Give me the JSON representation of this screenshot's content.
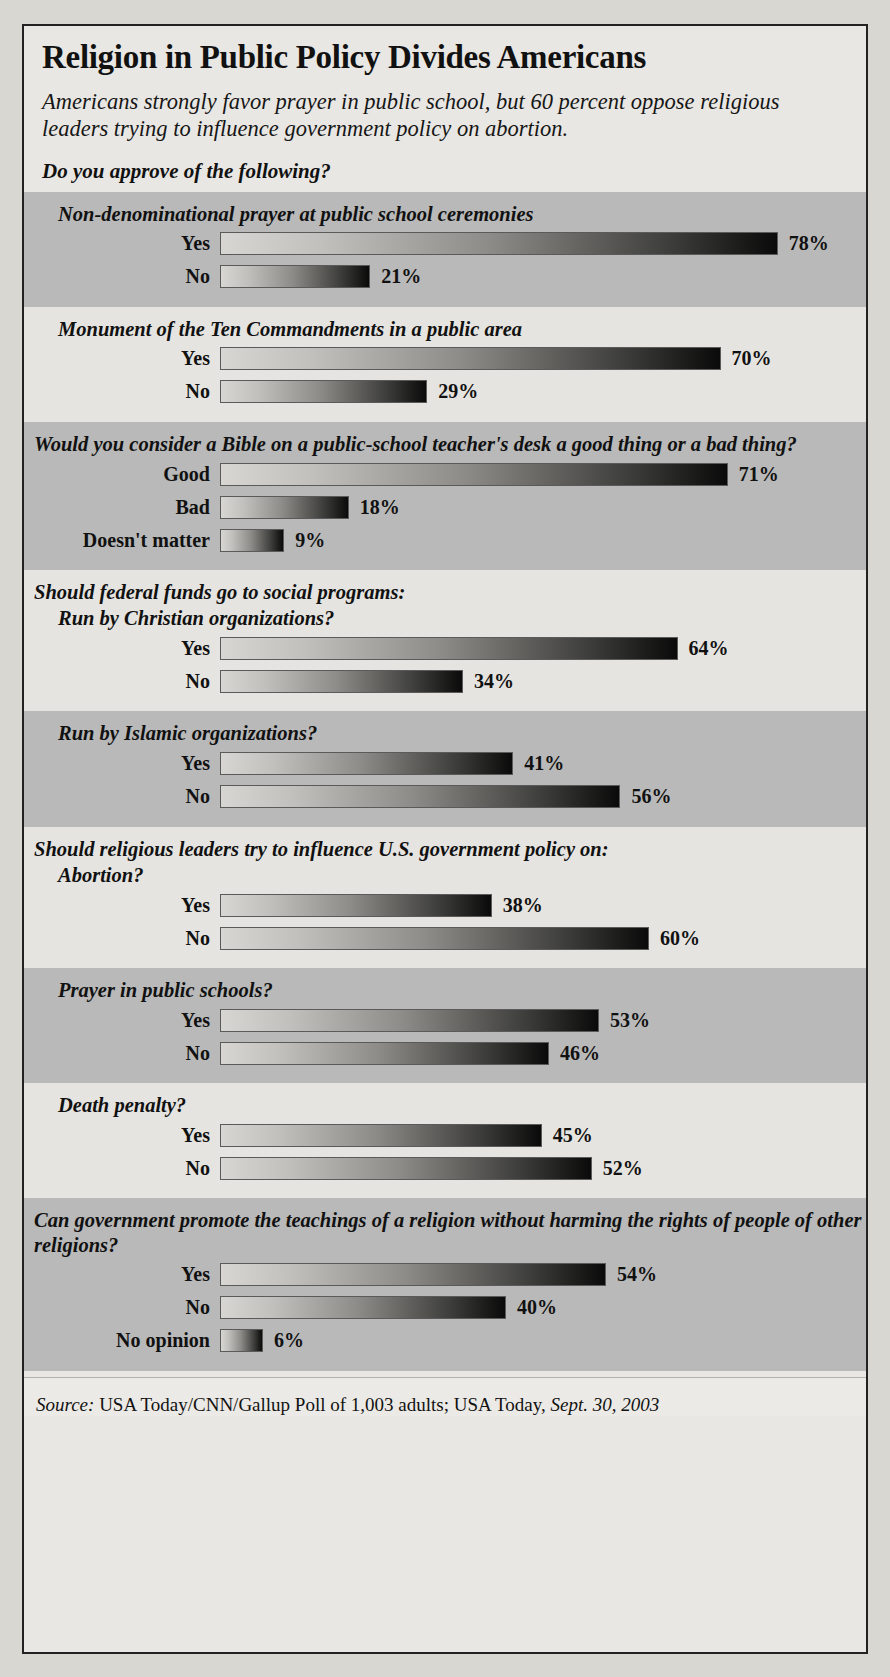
{
  "title": "Religion in Public Policy Divides Americans",
  "subtitle": "Americans strongly favor prayer in public school, but 60 percent oppose religious leaders trying to influence government policy on abortion.",
  "prompt": "Do you approve of the following?",
  "source": {
    "label": "Source:",
    "body": " USA Today/CNN/Gallup Poll of 1,003 adults; USA Today, ",
    "date": "Sept. 30, 2003"
  },
  "chart_data": {
    "type": "bar",
    "title": "Religion in Public Policy Divides Americans",
    "subtitle": "Americans strongly favor prayer in public school, but 60 percent oppose religious leaders trying to influence government policy on abortion.",
    "xlabel": "",
    "ylabel": "",
    "xlim": [
      0,
      100
    ],
    "unit": "%",
    "grid": false,
    "legend": null,
    "orientation": "horizontal",
    "annotation": "Do you approve of the following?",
    "groups": [
      {
        "heading": "Non-denominational prayer at public school ceremonies",
        "heading_indent": "indent",
        "band": "dark",
        "categories": [
          "Yes",
          "No"
        ],
        "values": [
          78,
          21
        ],
        "labels": [
          "78%",
          "21%"
        ]
      },
      {
        "heading": "Monument of the Ten Commandments in a public area",
        "heading_indent": "indent",
        "band": "light",
        "categories": [
          "Yes",
          "No"
        ],
        "values": [
          70,
          29
        ],
        "labels": [
          "70%",
          "29%"
        ]
      },
      {
        "heading": "Would you consider a Bible on a public-school teacher's desk a good thing or a bad thing?",
        "heading_indent": "flush",
        "band": "dark",
        "categories": [
          "Good",
          "Bad",
          "Doesn't matter"
        ],
        "values": [
          71,
          18,
          9
        ],
        "labels": [
          "71%",
          "18%",
          "9%"
        ]
      },
      {
        "heading": "Should federal funds go to social programs:",
        "subheading": "Run by Christian organizations?",
        "heading_indent": "flush",
        "band": "light",
        "categories": [
          "Yes",
          "No"
        ],
        "values": [
          64,
          34
        ],
        "labels": [
          "64%",
          "34%"
        ]
      },
      {
        "heading": "Run by Islamic organizations?",
        "heading_indent": "indent",
        "band": "dark",
        "categories": [
          "Yes",
          "No"
        ],
        "values": [
          41,
          56
        ],
        "labels": [
          "41%",
          "56%"
        ]
      },
      {
        "heading": "Should religious leaders try to influence U.S. government policy on:",
        "subheading": "Abortion?",
        "heading_indent": "flush",
        "band": "light",
        "categories": [
          "Yes",
          "No"
        ],
        "values": [
          38,
          60
        ],
        "labels": [
          "38%",
          "60%"
        ]
      },
      {
        "heading": "Prayer in public schools?",
        "heading_indent": "indent",
        "band": "dark",
        "categories": [
          "Yes",
          "No"
        ],
        "values": [
          53,
          46
        ],
        "labels": [
          "53%",
          "46%"
        ]
      },
      {
        "heading": "Death penalty?",
        "heading_indent": "indent",
        "band": "light",
        "categories": [
          "Yes",
          "No"
        ],
        "values": [
          45,
          52
        ],
        "labels": [
          "45%",
          "52%"
        ]
      },
      {
        "heading": "Can government promote the teachings of a religion without harming the rights of people of other religions?",
        "heading_indent": "flush",
        "band": "dark",
        "categories": [
          "Yes",
          "No",
          "No opinion"
        ],
        "values": [
          54,
          40,
          6
        ],
        "labels": [
          "54%",
          "40%",
          "6%"
        ]
      }
    ]
  }
}
